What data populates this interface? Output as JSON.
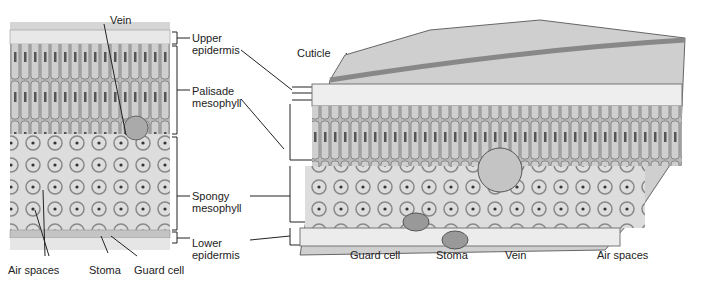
{
  "micrograph": {
    "labels": {
      "vein": "Vein",
      "air_spaces": "Air spaces",
      "stoma": "Stoma",
      "guard_cell": "Guard cell"
    }
  },
  "layers": {
    "upper_epidermis": [
      "Upper",
      "epidermis"
    ],
    "palisade_mesophyll": [
      "Palisade",
      "mesophyll"
    ],
    "spongy_mesophyll": [
      "Spongy",
      "mesophyll"
    ],
    "lower_epidermis": [
      "Lower",
      "epidermis"
    ]
  },
  "illustration": {
    "labels": {
      "cuticle": "Cuticle",
      "guard_cell": "Guard cell",
      "stoma": "Stoma",
      "vein": "Vein",
      "air_spaces": "Air spaces"
    }
  }
}
